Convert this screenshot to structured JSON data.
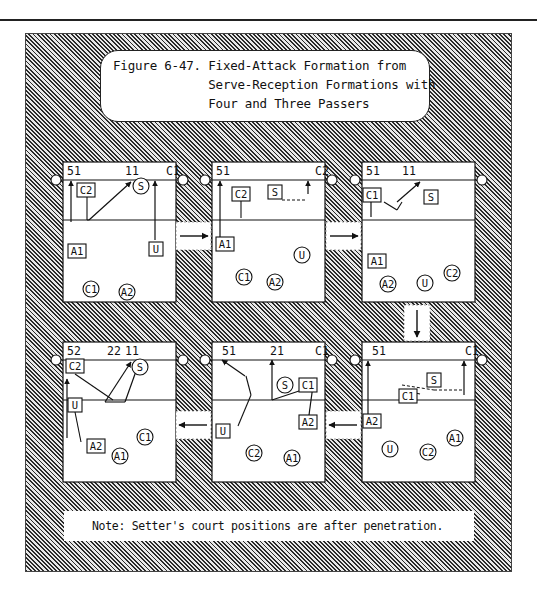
{
  "figure": {
    "title_lines": [
      "Figure 6-47. Fixed-Attack Formation from",
      "             Serve-Reception Formations with",
      "             Four and Three Passers"
    ],
    "note": "Note: Setter's court positions are after penetration."
  },
  "colors": {
    "ink": "#111111",
    "paper": "#ffffff",
    "hatch": "#2a2a2a"
  },
  "sequence": [
    "court-1 → court-2",
    "court-2 → court-3",
    "court-3 ↓ court-6",
    "court-6 ← court-5",
    "court-5 ← court-4"
  ],
  "courts": [
    {
      "id": "court-1",
      "net_labels": [
        {
          "text": "51",
          "pos": "left"
        },
        {
          "text": "11",
          "pos": "center"
        },
        {
          "text": "C1",
          "pos": "right"
        }
      ],
      "players": [
        {
          "label": "C2",
          "shape": "square",
          "zone": "front",
          "place": "left-center"
        },
        {
          "label": "S",
          "shape": "circle",
          "zone": "front",
          "place": "center-right"
        },
        {
          "label": "A1",
          "shape": "square",
          "zone": "back",
          "place": "left"
        },
        {
          "label": "U",
          "shape": "square",
          "zone": "back",
          "place": "right"
        },
        {
          "label": "C1",
          "shape": "circle",
          "zone": "back",
          "place": "left-center"
        },
        {
          "label": "A2",
          "shape": "circle",
          "zone": "back",
          "place": "center"
        }
      ]
    },
    {
      "id": "court-2",
      "net_labels": [
        {
          "text": "51",
          "pos": "left"
        },
        {
          "text": "C2",
          "pos": "right"
        }
      ],
      "players": [
        {
          "label": "C2",
          "shape": "square",
          "zone": "front",
          "place": "left-center"
        },
        {
          "label": "S",
          "shape": "square",
          "zone": "front",
          "place": "center"
        },
        {
          "label": "A1",
          "shape": "square",
          "zone": "back",
          "place": "left"
        },
        {
          "label": "U",
          "shape": "circle",
          "zone": "back",
          "place": "right"
        },
        {
          "label": "C1",
          "shape": "circle",
          "zone": "back",
          "place": "left-center"
        },
        {
          "label": "A2",
          "shape": "circle",
          "zone": "back",
          "place": "center"
        }
      ]
    },
    {
      "id": "court-3",
      "net_labels": [
        {
          "text": "51",
          "pos": "left"
        },
        {
          "text": "11",
          "pos": "center-left"
        }
      ],
      "players": [
        {
          "label": "C1",
          "shape": "square",
          "zone": "front",
          "place": "left"
        },
        {
          "label": "S",
          "shape": "square",
          "zone": "front",
          "place": "center-right"
        },
        {
          "label": "A1",
          "shape": "square",
          "zone": "back",
          "place": "left"
        },
        {
          "label": "C2",
          "shape": "circle",
          "zone": "back",
          "place": "right"
        },
        {
          "label": "A2",
          "shape": "circle",
          "zone": "back",
          "place": "left"
        },
        {
          "label": "U",
          "shape": "circle",
          "zone": "back",
          "place": "center"
        }
      ]
    },
    {
      "id": "court-4",
      "net_labels": [
        {
          "text": "52",
          "pos": "left"
        },
        {
          "text": "22",
          "pos": "center"
        },
        {
          "text": "11",
          "pos": "center"
        }
      ],
      "players": [
        {
          "label": "C2",
          "shape": "square",
          "zone": "front",
          "place": "left"
        },
        {
          "label": "S",
          "shape": "circle",
          "zone": "front",
          "place": "center-right"
        },
        {
          "label": "U",
          "shape": "square",
          "zone": "back",
          "place": "left"
        },
        {
          "label": "A2",
          "shape": "square",
          "zone": "back",
          "place": "left-center"
        },
        {
          "label": "C1",
          "shape": "circle",
          "zone": "back",
          "place": "right"
        },
        {
          "label": "A1",
          "shape": "circle",
          "zone": "back",
          "place": "center"
        }
      ]
    },
    {
      "id": "court-5",
      "net_labels": [
        {
          "text": "51",
          "pos": "left"
        },
        {
          "text": "21",
          "pos": "center"
        },
        {
          "text": "C1",
          "pos": "right"
        }
      ],
      "players": [
        {
          "label": "S",
          "shape": "circle",
          "zone": "front",
          "place": "center-right"
        },
        {
          "label": "C1",
          "shape": "square",
          "zone": "front",
          "place": "right"
        },
        {
          "label": "U",
          "shape": "square",
          "zone": "back",
          "place": "left"
        },
        {
          "label": "A2",
          "shape": "square",
          "zone": "back",
          "place": "right"
        },
        {
          "label": "C2",
          "shape": "circle",
          "zone": "back",
          "place": "left-center"
        },
        {
          "label": "A1",
          "shape": "circle",
          "zone": "back",
          "place": "center"
        }
      ]
    },
    {
      "id": "court-6",
      "net_labels": [
        {
          "text": "51",
          "pos": "left"
        },
        {
          "text": "C1",
          "pos": "right"
        }
      ],
      "players": [
        {
          "label": "S",
          "shape": "square",
          "zone": "front",
          "place": "center-right"
        },
        {
          "label": "C1",
          "shape": "square",
          "zone": "front",
          "place": "center"
        },
        {
          "label": "A2",
          "shape": "square",
          "zone": "back",
          "place": "left"
        },
        {
          "label": "U",
          "shape": "circle",
          "zone": "back",
          "place": "left"
        },
        {
          "label": "C2",
          "shape": "circle",
          "zone": "back",
          "place": "center"
        },
        {
          "label": "A1",
          "shape": "circle",
          "zone": "back",
          "place": "right"
        }
      ]
    }
  ]
}
